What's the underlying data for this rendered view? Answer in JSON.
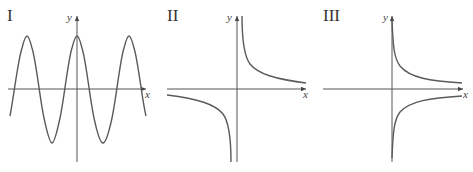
{
  "figure": {
    "panels": [
      {
        "id": "I",
        "label": "I",
        "x_axis_label": "x",
        "y_axis_label": "y",
        "curve": "cosine",
        "description": "Periodic cosine-like wave crossing the x-axis, maximum on the y-axis"
      },
      {
        "id": "II",
        "label": "II",
        "x_axis_label": "x",
        "y_axis_label": "y",
        "curve": "reciprocal",
        "description": "Hyperbola y = 1/x with branches in quadrants I and III"
      },
      {
        "id": "III",
        "label": "III",
        "x_axis_label": "x",
        "y_axis_label": "y",
        "curve": "two-branch-right",
        "description": "Two branches for x > 0, one above and one below the x-axis, asymptotic to both axes"
      }
    ],
    "colors": {
      "axis": "#555555",
      "curve": "#5a5a5a",
      "label": "#333333"
    }
  }
}
